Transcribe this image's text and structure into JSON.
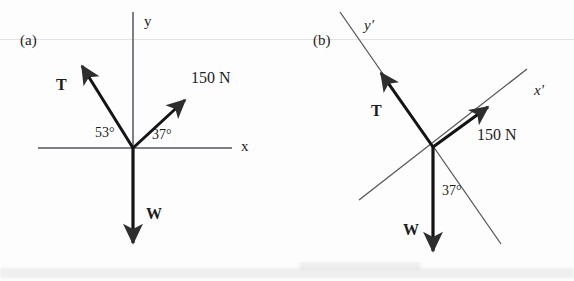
{
  "figure": {
    "panels": [
      {
        "tag": "(a)",
        "tag_pos": {
          "x": 20,
          "y": 33
        },
        "origin": {
          "x": 133,
          "y": 148
        },
        "axes": [
          {
            "name": "y",
            "label": "y",
            "italic": false,
            "label_pos": {
              "x": 144,
              "y": 14
            },
            "x1": 133,
            "y1": 12,
            "x2": 133,
            "y2": 178
          },
          {
            "name": "x",
            "label": "x",
            "italic": false,
            "label_pos": {
              "x": 241,
              "y": 139
            },
            "x1": 38,
            "y1": 148,
            "x2": 232,
            "y2": 148
          }
        ],
        "vectors": [
          {
            "name": "T",
            "label": "T",
            "bold": true,
            "label_pos": {
              "x": 56,
              "y": 77
            },
            "tip": {
              "x": 79,
              "y": 63
            }
          },
          {
            "name": "150 N",
            "label": "150 N",
            "bold": false,
            "label_pos": {
              "x": 191,
              "y": 70
            },
            "tip": {
              "x": 189,
              "y": 97
            }
          },
          {
            "name": "W",
            "label": "W",
            "bold": true,
            "label_pos": {
              "x": 146,
              "y": 206
            },
            "tip": {
              "x": 133,
              "y": 250
            }
          }
        ],
        "angles": [
          {
            "value": "53°",
            "pos": {
              "x": 95,
              "y": 126
            }
          },
          {
            "value": "37°",
            "pos": {
              "x": 152,
              "y": 128
            }
          }
        ]
      },
      {
        "tag": "(b)",
        "tag_pos": {
          "x": 313,
          "y": 33
        },
        "origin": {
          "x": 433,
          "y": 147
        },
        "axes": [
          {
            "name": "y-prime",
            "label": "y'",
            "italic": true,
            "label_pos": {
              "x": 364,
              "y": 18
            },
            "x1": 340,
            "y1": 12,
            "x2": 500,
            "y2": 243
          },
          {
            "name": "x-prime",
            "label": "x'",
            "italic": true,
            "label_pos": {
              "x": 534,
              "y": 83
            },
            "x1": 359,
            "y1": 200,
            "x2": 525,
            "y2": 70
          }
        ],
        "vectors": [
          {
            "name": "T",
            "label": "T",
            "bold": true,
            "label_pos": {
              "x": 371,
              "y": 103
            },
            "tip": {
              "x": 377,
              "y": 68
            }
          },
          {
            "name": "150 N",
            "label": "150 N",
            "bold": false,
            "label_pos": {
              "x": 477,
              "y": 127
            },
            "tip": {
              "x": 492,
              "y": 103
            }
          },
          {
            "name": "W",
            "label": "W",
            "bold": true,
            "label_pos": {
              "x": 403,
              "y": 222
            },
            "tip": {
              "x": 433,
              "y": 258
            }
          }
        ],
        "angles": [
          {
            "value": "37°",
            "pos": {
              "x": 442,
              "y": 184
            }
          }
        ]
      }
    ],
    "colors": {
      "ink": "#1d1d1d",
      "vector_stroke": "#111111",
      "axis_stroke": "#4a4a4a",
      "arrowhead_fill": "#3a3a3a",
      "background": "#fdfdfd"
    }
  }
}
